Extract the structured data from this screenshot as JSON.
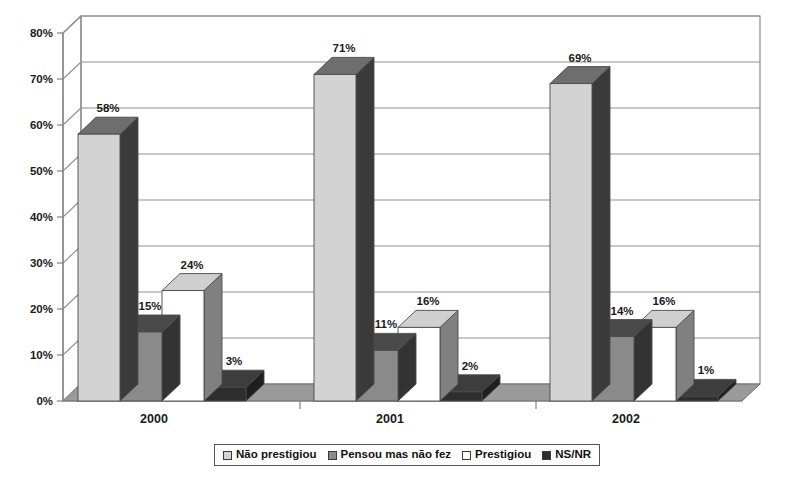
{
  "chart_data": {
    "type": "bar",
    "title": "",
    "subtitle": "",
    "xlabel": "",
    "ylabel": "",
    "categories": [
      "2000",
      "2001",
      "2002"
    ],
    "series": [
      {
        "name": "Não prestigiou",
        "values": [
          58,
          71,
          69
        ],
        "color": "#d3d3d3"
      },
      {
        "name": "Pensou mas não fez",
        "values": [
          15,
          11,
          14
        ],
        "color": "#8a8a8a"
      },
      {
        "name": "Prestigiou",
        "values": [
          24,
          16,
          16
        ],
        "color": "#ffffff"
      },
      {
        "name": "NS/NR",
        "values": [
          3,
          2,
          1
        ],
        "color": "#2e2e2e"
      }
    ],
    "ylim": [
      0,
      80
    ],
    "ytick_labels": [
      "0%",
      "10%",
      "20%",
      "30%",
      "40%",
      "50%",
      "60%",
      "70%",
      "80%"
    ],
    "ytick_values": [
      0,
      10,
      20,
      30,
      40,
      50,
      60,
      70,
      80
    ],
    "value_label_suffix": "%",
    "grid": true,
    "legend_position": "bottom",
    "three_d": true
  },
  "legend": {
    "items": [
      {
        "label": "Não prestigiou"
      },
      {
        "label": "Pensou mas não fez"
      },
      {
        "label": "Prestigiou"
      },
      {
        "label": "NS/NR"
      }
    ]
  },
  "colors": {
    "series_1_front": "#d3d3d3",
    "series_1_side": "#3a3a3a",
    "series_1_top": "#6e6e6e",
    "series_2_front": "#8a8a8a",
    "series_2_side": "#333333",
    "series_2_top": "#4a4a4a",
    "series_3_front": "#ffffff",
    "series_3_side": "#808080",
    "series_3_top": "#cfcfcf",
    "series_4_front": "#2e2e2e",
    "series_4_side": "#1f1f1f",
    "series_4_top": "#3d3d3d",
    "floor": "#9a9a9a",
    "grid": "#909090",
    "axis": "#808080"
  }
}
